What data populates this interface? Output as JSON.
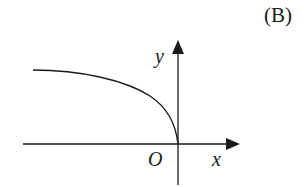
{
  "option_label": "(B)",
  "axes": {
    "x_label": "x",
    "y_label": "y",
    "origin_label": "O"
  },
  "curve": {
    "description": "decreasing concave-down curve in second quadrant approaching horizontal at left, reaching origin vertically",
    "color": "#1a1a1a"
  },
  "colors": {
    "stroke": "#1a1a1a",
    "background": "#ffffff"
  }
}
